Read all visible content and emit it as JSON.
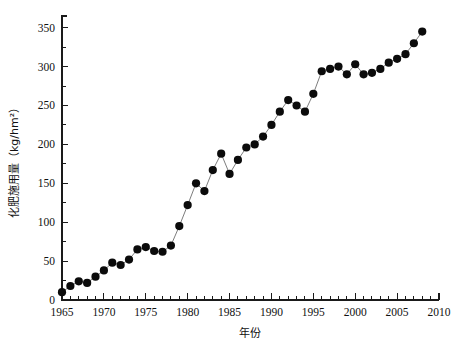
{
  "chart_data": {
    "type": "scatter",
    "title": "",
    "xlabel": "年份",
    "ylabel": "化肥施用量（kg/hm²）",
    "xlim": [
      1965,
      2010
    ],
    "ylim": [
      0,
      365
    ],
    "grid": false,
    "legend": null,
    "x_ticks": [
      1965,
      1970,
      1975,
      1980,
      1985,
      1990,
      1995,
      2000,
      2005,
      2010
    ],
    "x_tick_labels": [
      "1965",
      "1970",
      "1975",
      "1980",
      "1985",
      "1990",
      "1995",
      "2000",
      "2005",
      "2010"
    ],
    "x_minor_step": 1,
    "y_ticks": [
      0,
      50,
      100,
      150,
      200,
      250,
      300,
      350
    ],
    "y_tick_labels": [
      "0",
      "50",
      "100",
      "150",
      "200",
      "250",
      "300",
      "350"
    ],
    "y_minor_step": 25,
    "marker": "filled-circle",
    "marker_color": "#0b0b0b",
    "line_color": "#6e6e6e",
    "x": [
      1965,
      1966,
      1967,
      1968,
      1969,
      1970,
      1971,
      1972,
      1973,
      1974,
      1975,
      1976,
      1977,
      1978,
      1979,
      1980,
      1981,
      1982,
      1983,
      1984,
      1985,
      1986,
      1987,
      1988,
      1989,
      1990,
      1991,
      1992,
      1993,
      1994,
      1995,
      1996,
      1997,
      1998,
      1999,
      2000,
      2001,
      2002,
      2003,
      2004,
      2005,
      2006,
      2007,
      2008
    ],
    "y": [
      10,
      18,
      24,
      22,
      30,
      38,
      48,
      45,
      52,
      65,
      68,
      63,
      62,
      70,
      95,
      122,
      150,
      140,
      167,
      188,
      162,
      180,
      196,
      200,
      210,
      225,
      242,
      257,
      250,
      242,
      265,
      294,
      297,
      300,
      290,
      303,
      290,
      292,
      297,
      305,
      310,
      316,
      330,
      345
    ]
  },
  "figure": {
    "background_color": "#ffffff",
    "axis_color": "#1a1a1a"
  }
}
